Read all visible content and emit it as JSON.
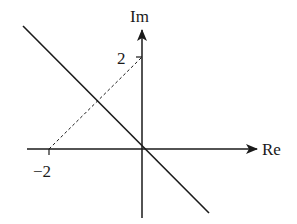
{
  "diagram": {
    "type": "complex-plane",
    "axes": {
      "x_label": "Re",
      "y_label": "Im"
    },
    "ticks": {
      "x": {
        "value": -2,
        "label": "−2"
      },
      "y": {
        "value": 2,
        "label": "2"
      }
    },
    "elements": [
      {
        "kind": "solid-line",
        "description": "line through origin with slope -1 (Im = -Re)"
      },
      {
        "kind": "dashed-segment",
        "from": [
          -2,
          0
        ],
        "to": [
          0,
          2
        ]
      }
    ],
    "colors": {
      "ink": "#1a1a1a",
      "background": "#ffffff"
    }
  }
}
